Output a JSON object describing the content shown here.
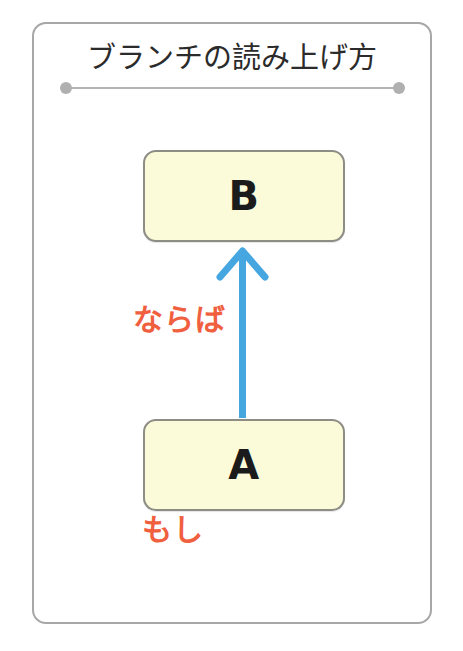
{
  "diagram": {
    "title": "ブランチの読み上げ方",
    "type": "branch-reading-diagram",
    "frame": {
      "border_color": "#a7a7a7"
    },
    "divider": {
      "line_color": "#b3b3b3",
      "dot_color": "#b0b0b0",
      "left_dot": "divider-dot-left",
      "right_dot": "divider-dot-right"
    },
    "nodes": [
      {
        "id": "node-b",
        "label": "B",
        "fill": "#fbfbd9",
        "border": "#8d8d86",
        "role": "consequent"
      },
      {
        "id": "node-a",
        "label": "A",
        "fill": "#fbfbd9",
        "border": "#8d8d86",
        "role": "antecedent"
      }
    ],
    "arrow": {
      "name": "upward-arrow",
      "color": "#45a6e0",
      "direction": "up",
      "from": "A",
      "to": "B"
    },
    "annotations": [
      {
        "id": "annot-naraba",
        "text": "ならば",
        "color": "#f0603f",
        "attached_to": "arrow"
      },
      {
        "id": "annot-moshi",
        "text": "もし",
        "color": "#f0603f",
        "attached_to": "node-a"
      }
    ]
  }
}
